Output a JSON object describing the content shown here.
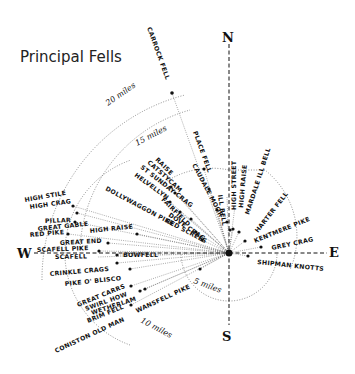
{
  "title": "Principal Fells",
  "compass": {
    "north": "N",
    "south": "S",
    "east": "E",
    "west": "W"
  },
  "rings": [
    {
      "label": "5 miles"
    },
    {
      "label": "10 miles"
    },
    {
      "label": "15 miles"
    },
    {
      "label": "20 miles"
    }
  ],
  "fells": [
    {
      "name": "CARROCK FELL"
    },
    {
      "name": "PLACE FELL"
    },
    {
      "name": "CAUDALE MOOR"
    },
    {
      "name": "ILL BELL"
    },
    {
      "name": "HIGH STREET"
    },
    {
      "name": "HIGH RAISE"
    },
    {
      "name": "MARDALE ILL BELL"
    },
    {
      "name": "HARTER FELL"
    },
    {
      "name": "KENTMERE PIKE"
    },
    {
      "name": "GREY CRAG"
    },
    {
      "name": "SHIPMAN KNOTTS"
    },
    {
      "name": "RAISE"
    },
    {
      "name": "CATSTYCAM"
    },
    {
      "name": "ST SUNDAY CRAG"
    },
    {
      "name": "HELVELLYN"
    },
    {
      "name": "DOLLYWAGGON PIKE"
    },
    {
      "name": "FAIRFIELD"
    },
    {
      "name": "DOVE CRAG"
    },
    {
      "name": "RED SCREES"
    },
    {
      "name": "HIGH STILE"
    },
    {
      "name": "HIGH CRAG"
    },
    {
      "name": "PILLAR"
    },
    {
      "name": "GREAT GABLE"
    },
    {
      "name": "RED PIKE"
    },
    {
      "name": "HIGH RAISE (W)",
      "display": "HIGH RAISE"
    },
    {
      "name": "GREAT END"
    },
    {
      "name": "SCAFELL PIKE"
    },
    {
      "name": "SCAFELL"
    },
    {
      "name": "BOWFELL"
    },
    {
      "name": "CRINKLE CRAGS"
    },
    {
      "name": "PIKE O' BLISCO"
    },
    {
      "name": "GREAT CARRS"
    },
    {
      "name": "SWIRL HOW"
    },
    {
      "name": "WETHERLAM"
    },
    {
      "name": "BRIM FELL"
    },
    {
      "name": "CONISTON OLD MAN"
    },
    {
      "name": "WANSFELL PIKE"
    }
  ]
}
